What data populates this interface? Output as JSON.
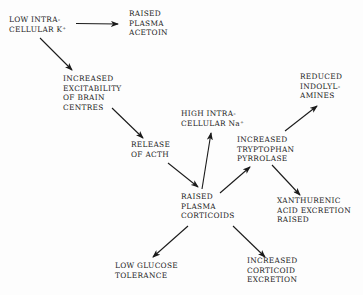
{
  "diagram": {
    "type": "flowchart",
    "nodes": [
      {
        "id": "low_k",
        "lines": [
          "LOW INTRA-",
          "CELLULAR K⁺"
        ]
      },
      {
        "id": "raised_acetoin",
        "lines": [
          "RAISED",
          "PLASMA",
          "ACETOIN"
        ]
      },
      {
        "id": "excitability",
        "lines": [
          "INCREASED",
          "EXCITABILITY",
          "OF BRAIN",
          "CENTRES"
        ]
      },
      {
        "id": "acth",
        "lines": [
          "RELEASE",
          "OF ACTH"
        ]
      },
      {
        "id": "high_na",
        "lines": [
          "HIGH INTRA-",
          "CELLULAR Na⁺"
        ]
      },
      {
        "id": "tryptophan",
        "lines": [
          "INCREASED",
          "TRYPTOPHAN",
          "PYRROLASE"
        ]
      },
      {
        "id": "indolylamines",
        "lines": [
          "REDUCED",
          "INDOLYL-",
          "AMINES"
        ]
      },
      {
        "id": "corticoids",
        "lines": [
          "RAISED",
          "PLASMA",
          "CORTICOIDS"
        ]
      },
      {
        "id": "xanthurenic",
        "lines": [
          "XANTHURENIC",
          "ACID EXCRETION",
          "RAISED"
        ]
      },
      {
        "id": "glucose",
        "lines": [
          "LOW GLUCOSE",
          "TOLERANCE"
        ]
      },
      {
        "id": "corticoid_excretion",
        "lines": [
          "INCREASED",
          "CORTICOID",
          "EXCRETION"
        ]
      }
    ],
    "edges": [
      {
        "from": "low_k",
        "to": "raised_acetoin"
      },
      {
        "from": "low_k",
        "to": "excitability"
      },
      {
        "from": "excitability",
        "to": "acth"
      },
      {
        "from": "acth",
        "to": "corticoids"
      },
      {
        "from": "corticoids",
        "to": "high_na"
      },
      {
        "from": "corticoids",
        "to": "tryptophan"
      },
      {
        "from": "tryptophan",
        "to": "indolylamines"
      },
      {
        "from": "tryptophan",
        "to": "xanthurenic"
      },
      {
        "from": "corticoids",
        "to": "glucose"
      },
      {
        "from": "corticoids",
        "to": "corticoid_excretion"
      }
    ],
    "colors": {
      "ink": "#1a1a1a",
      "background": "#fdfdfd"
    }
  }
}
